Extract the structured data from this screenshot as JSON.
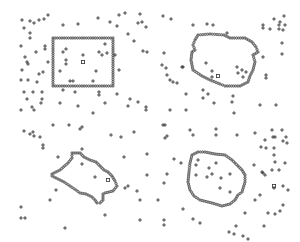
{
  "figure": {
    "colors": {
      "background": "#ffffff",
      "markers": "#333333",
      "contour": "#555555"
    },
    "panels": [
      {
        "name": "rectangle",
        "contour": [
          [
            53,
            38
          ],
          [
            113,
            38
          ],
          [
            113,
            86
          ],
          [
            53,
            86
          ]
        ],
        "square": [
          83,
          62
        ],
        "plus": [
          [
            22,
            20
          ],
          [
            30,
            21
          ],
          [
            34,
            23
          ],
          [
            39,
            20
          ],
          [
            44,
            19
          ],
          [
            48,
            15
          ],
          [
            63,
            25
          ],
          [
            78,
            24
          ],
          [
            98,
            18
          ],
          [
            110,
            22
          ],
          [
            117,
            26
          ],
          [
            119,
            15
          ],
          [
            125,
            13
          ],
          [
            140,
            14
          ],
          [
            142,
            22
          ],
          [
            146,
            27
          ],
          [
            138,
            23
          ],
          [
            128,
            34
          ],
          [
            134,
            41
          ],
          [
            143,
            51
          ],
          [
            147,
            52
          ],
          [
            24,
            28
          ],
          [
            30,
            33
          ],
          [
            30,
            38
          ],
          [
            21,
            46
          ],
          [
            36,
            52
          ],
          [
            45,
            46
          ],
          [
            45,
            49
          ],
          [
            25,
            57
          ],
          [
            27,
            62
          ],
          [
            28,
            64
          ],
          [
            22,
            70
          ],
          [
            48,
            62
          ],
          [
            43,
            72
          ],
          [
            39,
            74
          ],
          [
            21,
            80
          ],
          [
            28,
            80
          ],
          [
            37,
            82
          ],
          [
            63,
            52
          ],
          [
            66,
            49
          ],
          [
            66,
            60
          ],
          [
            66,
            64
          ],
          [
            60,
            71
          ],
          [
            83,
            55
          ],
          [
            99,
            52
          ],
          [
            102,
            55
          ],
          [
            107,
            53
          ],
          [
            105,
            44
          ],
          [
            115,
            55
          ],
          [
            119,
            70
          ],
          [
            96,
            71
          ],
          [
            70,
            81
          ],
          [
            73,
            81
          ],
          [
            93,
            81
          ],
          [
            63,
            90
          ],
          [
            75,
            92
          ],
          [
            99,
            92
          ],
          [
            99,
            95
          ],
          [
            24,
            92
          ],
          [
            33,
            92
          ],
          [
            42,
            92
          ],
          [
            27,
            99
          ],
          [
            42,
            99
          ],
          [
            41,
            103
          ],
          [
            32,
            107
          ],
          [
            34,
            110
          ],
          [
            60,
            103
          ],
          [
            78,
            106
          ],
          [
            93,
            113
          ],
          [
            105,
            103
          ],
          [
            117,
            94
          ],
          [
            128,
            106
          ],
          [
            130,
            99
          ],
          [
            138,
            102
          ],
          [
            146,
            107
          ],
          [
            146,
            110
          ],
          [
            21,
            110
          ]
        ]
      },
      {
        "name": "blob",
        "contour": [
          [
            195,
            40
          ],
          [
            198,
            35
          ],
          [
            210,
            34
          ],
          [
            224,
            35
          ],
          [
            230,
            38
          ],
          [
            245,
            38
          ],
          [
            252,
            42
          ],
          [
            256,
            47
          ],
          [
            258,
            52
          ],
          [
            253,
            55
          ],
          [
            255,
            62
          ],
          [
            253,
            70
          ],
          [
            250,
            76
          ],
          [
            248,
            82
          ],
          [
            240,
            86
          ],
          [
            225,
            86
          ],
          [
            220,
            84
          ],
          [
            210,
            80
          ],
          [
            202,
            76
          ],
          [
            193,
            70
          ],
          [
            191,
            60
          ],
          [
            192,
            52
          ],
          [
            195,
            50
          ],
          [
            193,
            45
          ]
        ],
        "square": [
          218,
          76
        ],
        "plus": [
          [
            163,
            16
          ],
          [
            171,
            19
          ],
          [
            193,
            25
          ],
          [
            207,
            24
          ],
          [
            213,
            25
          ],
          [
            227,
            33
          ],
          [
            263,
            25
          ],
          [
            263,
            28
          ],
          [
            270,
            29
          ],
          [
            274,
            19
          ],
          [
            279,
            25
          ],
          [
            279,
            29
          ],
          [
            280,
            22
          ],
          [
            283,
            30
          ],
          [
            284,
            16
          ],
          [
            285,
            25
          ],
          [
            282,
            43
          ],
          [
            282,
            54
          ],
          [
            263,
            57
          ],
          [
            164,
            53
          ],
          [
            162,
            65
          ],
          [
            166,
            68
          ],
          [
            167,
            75
          ],
          [
            170,
            80
          ],
          [
            173,
            82
          ],
          [
            177,
            83
          ],
          [
            182,
            67
          ],
          [
            183,
            67
          ],
          [
            206,
            63
          ],
          [
            212,
            71
          ],
          [
            212,
            77
          ],
          [
            237,
            67
          ],
          [
            238,
            73
          ],
          [
            242,
            70
          ],
          [
            243,
            77
          ],
          [
            246,
            72
          ],
          [
            266,
            75
          ],
          [
            266,
            78
          ],
          [
            186,
            94
          ],
          [
            203,
            90
          ],
          [
            203,
            98
          ],
          [
            208,
            94
          ],
          [
            214,
            103
          ],
          [
            232,
            102
          ],
          [
            233,
            96
          ],
          [
            260,
            105
          ],
          [
            276,
            105
          ],
          [
            170,
            110
          ],
          [
            186,
            110
          ],
          [
            234,
            113
          ]
        ]
      },
      {
        "name": "fish",
        "contour": [
          [
            52,
            174
          ],
          [
            60,
            170
          ],
          [
            68,
            163
          ],
          [
            72,
            158
          ],
          [
            72,
            153
          ],
          [
            80,
            153
          ],
          [
            84,
            157
          ],
          [
            90,
            160
          ],
          [
            96,
            162
          ],
          [
            100,
            166
          ],
          [
            104,
            170
          ],
          [
            108,
            172
          ],
          [
            112,
            176
          ],
          [
            115,
            181
          ],
          [
            117,
            186
          ],
          [
            113,
            191
          ],
          [
            105,
            193
          ],
          [
            103,
            194
          ],
          [
            103,
            200
          ],
          [
            100,
            203
          ],
          [
            97,
            203
          ],
          [
            95,
            200
          ],
          [
            92,
            197
          ],
          [
            86,
            194
          ],
          [
            80,
            193
          ],
          [
            76,
            190
          ],
          [
            70,
            186
          ],
          [
            64,
            182
          ],
          [
            58,
            179
          ],
          [
            52,
            176
          ]
        ],
        "square": [
          108,
          180
        ],
        "plus": [
          [
            24,
            131
          ],
          [
            30,
            134
          ],
          [
            33,
            132
          ],
          [
            34,
            136
          ],
          [
            40,
            137
          ],
          [
            53,
            125
          ],
          [
            69,
            125
          ],
          [
            80,
            129
          ],
          [
            82,
            127
          ],
          [
            111,
            135
          ],
          [
            121,
            137
          ],
          [
            134,
            132
          ],
          [
            43,
            145
          ],
          [
            43,
            148
          ],
          [
            58,
            157
          ],
          [
            82,
            149
          ],
          [
            82,
            164
          ],
          [
            95,
            177
          ],
          [
            124,
            157
          ],
          [
            147,
            154
          ],
          [
            147,
            175
          ],
          [
            56,
            190
          ],
          [
            50,
            200
          ],
          [
            128,
            186
          ],
          [
            125,
            188
          ],
          [
            137,
            191
          ],
          [
            140,
            200
          ],
          [
            105,
            215
          ],
          [
            21,
            218
          ],
          [
            25,
            218
          ],
          [
            65,
            228
          ],
          [
            140,
            220
          ],
          [
            21,
            207
          ]
        ]
      },
      {
        "name": "ellipse",
        "contour": [
          [
            192,
            155
          ],
          [
            198,
            152
          ],
          [
            205,
            152
          ],
          [
            215,
            154
          ],
          [
            225,
            155
          ],
          [
            232,
            160
          ],
          [
            235,
            163
          ],
          [
            238,
            166
          ],
          [
            242,
            170
          ],
          [
            245,
            175
          ],
          [
            245,
            182
          ],
          [
            242,
            192
          ],
          [
            238,
            195
          ],
          [
            235,
            200
          ],
          [
            230,
            204
          ],
          [
            222,
            206
          ],
          [
            212,
            203
          ],
          [
            200,
            200
          ],
          [
            194,
            196
          ],
          [
            190,
            190
          ],
          [
            188,
            182
          ],
          [
            189,
            172
          ],
          [
            190,
            163
          ]
        ],
        "square": [
          274,
          186
        ],
        "plus": [
          [
            163,
            125
          ],
          [
            165,
            125
          ],
          [
            165,
            138
          ],
          [
            167,
            136
          ],
          [
            190,
            130
          ],
          [
            193,
            135
          ],
          [
            216,
            129
          ],
          [
            216,
            135
          ],
          [
            237,
            135
          ],
          [
            255,
            133
          ],
          [
            272,
            130
          ],
          [
            273,
            137
          ],
          [
            275,
            137
          ],
          [
            282,
            130
          ],
          [
            286,
            137
          ],
          [
            265,
            140
          ],
          [
            266,
            148
          ],
          [
            261,
            147
          ],
          [
            274,
            148
          ],
          [
            283,
            141
          ],
          [
            287,
            143
          ],
          [
            274,
            155
          ],
          [
            285,
            163
          ],
          [
            275,
            162
          ],
          [
            272,
            170
          ],
          [
            262,
            172
          ],
          [
            254,
            165
          ],
          [
            265,
            175
          ],
          [
            263,
            173
          ],
          [
            279,
            170
          ],
          [
            283,
            186
          ],
          [
            288,
            190
          ],
          [
            274,
            188
          ],
          [
            260,
            195
          ],
          [
            255,
            200
          ],
          [
            230,
            174
          ],
          [
            212,
            174
          ],
          [
            207,
            177
          ],
          [
            196,
            175
          ],
          [
            196,
            165
          ],
          [
            198,
            160
          ],
          [
            216,
            163
          ],
          [
            209,
            168
          ],
          [
            221,
            178
          ],
          [
            220,
            188
          ],
          [
            230,
            192
          ],
          [
            167,
            174
          ],
          [
            164,
            183
          ],
          [
            174,
            159
          ],
          [
            181,
            163
          ],
          [
            183,
            209
          ],
          [
            193,
            219
          ],
          [
            200,
            223
          ],
          [
            245,
            213
          ],
          [
            268,
            213
          ],
          [
            275,
            214
          ],
          [
            280,
            211
          ],
          [
            283,
            205
          ],
          [
            264,
            226
          ],
          [
            243,
            236
          ],
          [
            236,
            226
          ],
          [
            229,
            232
          ],
          [
            234,
            234
          ],
          [
            248,
            239
          ],
          [
            164,
            220
          ],
          [
            164,
            225
          ],
          [
            158,
            200
          ]
        ]
      }
    ],
    "legend": {
      "plus_marker": "scattered point",
      "circle_marker": "contour point",
      "square_marker": "center point"
    }
  }
}
